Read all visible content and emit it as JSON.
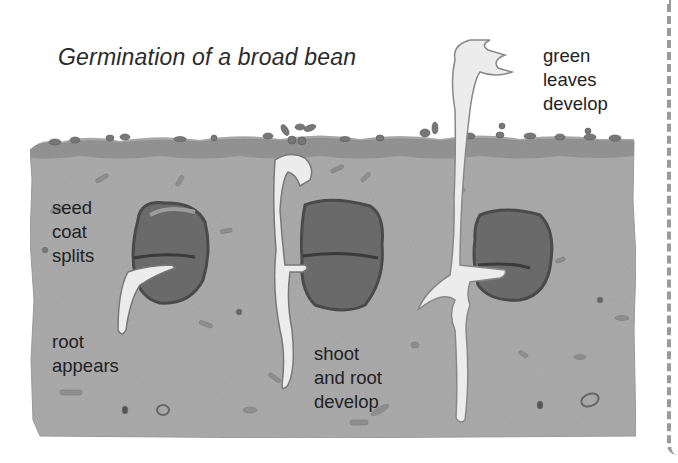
{
  "title": "Germination of a broad bean",
  "stages": [
    {
      "name": "stage-1",
      "labels": [
        {
          "lines": [
            "seed",
            "coat",
            "splits"
          ]
        },
        {
          "lines": [
            "root",
            "appears"
          ]
        }
      ]
    },
    {
      "name": "stage-2",
      "labels": [
        {
          "lines": [
            "shoot",
            "and root",
            "develop"
          ]
        }
      ]
    },
    {
      "name": "stage-3",
      "labels": [
        {
          "lines": [
            "green",
            "leaves",
            "develop"
          ]
        }
      ]
    }
  ],
  "colors": {
    "soil": "#a9a9a9",
    "soil_edge": "#7d7d7d",
    "seed_dark": "#5e5e5e",
    "seed_coat": "#8a8a8a",
    "sprout": "#ececec",
    "text": "#222222"
  }
}
